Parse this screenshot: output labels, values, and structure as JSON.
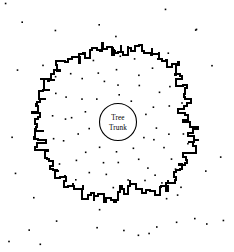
{
  "figure": {
    "background_color": "#ffffff",
    "ink_color": "#000000",
    "width": 234,
    "height": 252
  },
  "trunk": {
    "label_line1": "Tree",
    "label_line2": "Trunk",
    "center_x": 118,
    "center_y": 122,
    "radius": 18.5,
    "stroke_width": 1.1,
    "stroke_color": "#000000",
    "fill_color": "#ffffff"
  },
  "boundary": {
    "name": "root-zone-boundary",
    "stroke_color": "#000000",
    "stroke_width": 2.0,
    "style": "jagged-irregular-closed-curve",
    "center_x": 116,
    "center_y": 124,
    "mean_radius": 78,
    "bounds": {
      "left": 31,
      "right": 196,
      "top": 41,
      "bottom": 212
    },
    "radii": [
      72,
      70,
      76,
      74,
      71,
      78,
      80,
      77,
      74,
      79,
      82,
      80,
      77,
      81,
      84,
      80,
      78,
      82,
      79,
      76,
      80,
      83,
      81,
      78,
      82,
      85,
      83,
      80,
      78,
      82,
      80,
      77,
      74,
      78,
      81,
      79,
      76,
      73,
      70,
      74,
      77,
      74,
      71,
      68,
      64,
      67,
      71,
      74,
      72,
      69,
      73,
      77,
      80,
      78,
      75,
      79,
      82,
      80,
      77,
      81,
      84,
      82,
      79,
      76,
      79,
      82,
      80,
      77,
      74,
      78,
      81,
      79,
      76,
      79,
      83,
      81,
      78,
      75,
      78,
      82,
      80,
      77,
      80,
      83,
      81,
      78,
      75,
      72,
      69,
      66,
      63,
      60,
      58,
      62,
      66,
      70,
      68,
      65,
      69,
      73,
      76,
      74,
      71,
      75,
      78,
      76,
      73,
      70,
      74,
      77,
      75,
      72,
      76,
      79,
      77,
      74,
      71,
      75,
      78,
      76,
      73,
      77,
      80,
      78,
      75,
      72,
      76,
      79,
      77,
      74,
      78,
      81,
      79,
      76,
      73,
      77,
      80,
      78,
      75,
      79,
      82,
      80,
      77,
      74,
      78,
      81,
      79,
      76,
      80,
      83,
      81,
      78,
      75,
      79,
      82,
      80,
      77,
      81,
      84,
      82,
      79,
      76,
      80,
      83,
      81,
      78,
      82,
      85,
      83,
      80,
      77,
      81,
      84,
      82,
      79,
      83,
      86,
      84,
      81,
      78,
      82,
      80,
      77,
      74,
      78,
      81,
      79,
      76,
      73,
      77,
      80,
      78,
      75,
      72,
      76,
      79,
      77,
      74,
      71,
      75
    ]
  },
  "scatter_dots": {
    "name": "soil-particle-dots",
    "color": "#000000",
    "size_px": 1.6,
    "count_inside": 96,
    "count_outside": 34,
    "arrangement": "concentric-rings-with-jitter",
    "ring_radii": [
      30,
      42,
      54,
      66,
      78,
      92,
      106,
      120
    ],
    "ring_counts": [
      10,
      13,
      16,
      18,
      20,
      19,
      12,
      8
    ]
  }
}
